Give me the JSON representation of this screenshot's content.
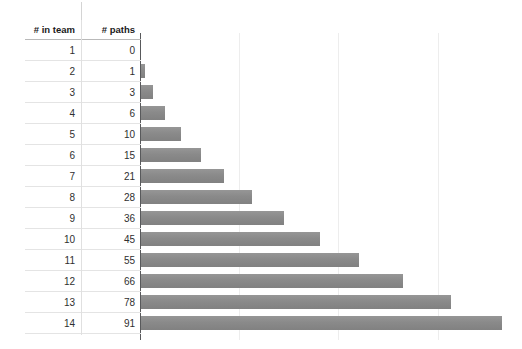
{
  "chart_data": {
    "type": "bar",
    "orientation": "horizontal",
    "title": "",
    "xlabel": "",
    "ylabel": "",
    "categories": [
      "1",
      "2",
      "3",
      "4",
      "5",
      "6",
      "7",
      "8",
      "9",
      "10",
      "11",
      "12",
      "13",
      "14"
    ],
    "values": [
      0,
      1,
      3,
      6,
      10,
      15,
      21,
      28,
      36,
      45,
      55,
      66,
      78,
      91
    ],
    "xlim": [
      0,
      96
    ],
    "grid": true,
    "gridlines_x": [
      25,
      50,
      75
    ],
    "legend": "none",
    "bar_color": "#8a8a8a",
    "axis_color": "#58595b",
    "gridline_color": "#ededed"
  },
  "table": {
    "headers": {
      "team": "# in team",
      "paths": "# paths"
    },
    "rows": [
      {
        "team": "1",
        "paths": "0"
      },
      {
        "team": "2",
        "paths": "1"
      },
      {
        "team": "3",
        "paths": "3"
      },
      {
        "team": "4",
        "paths": "6"
      },
      {
        "team": "5",
        "paths": "10"
      },
      {
        "team": "6",
        "paths": "15"
      },
      {
        "team": "7",
        "paths": "21"
      },
      {
        "team": "8",
        "paths": "28"
      },
      {
        "team": "9",
        "paths": "36"
      },
      {
        "team": "10",
        "paths": "45"
      },
      {
        "team": "11",
        "paths": "55"
      },
      {
        "team": "12",
        "paths": "66"
      },
      {
        "team": "13",
        "paths": "78"
      },
      {
        "team": "14",
        "paths": "91"
      }
    ]
  }
}
